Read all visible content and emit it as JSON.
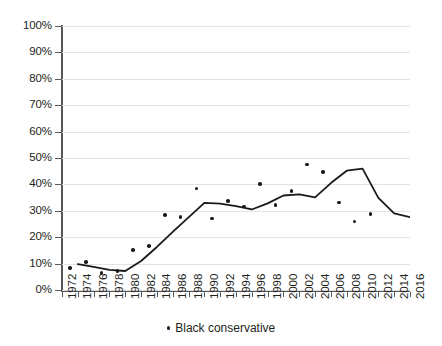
{
  "chart_data": {
    "type": "line",
    "title": "",
    "subtitle": "",
    "xlabel": "",
    "ylabel": "",
    "xlim": [
      1972,
      2016
    ],
    "ylim": [
      0,
      100
    ],
    "grid": true,
    "legend_position": "bottom-center",
    "y_ticks": [
      "0%",
      "10%",
      "20%",
      "30%",
      "40%",
      "50%",
      "60%",
      "70%",
      "80%",
      "90%",
      "100%"
    ],
    "y_tick_values": [
      0,
      10,
      20,
      30,
      40,
      50,
      60,
      70,
      80,
      90,
      100
    ],
    "x_ticks": [
      "1972",
      "1974",
      "1976",
      "1978",
      "1980",
      "1982",
      "1984",
      "1986",
      "1988",
      "1990",
      "1992",
      "1994",
      "1996",
      "1998",
      "2000",
      "2002",
      "2004",
      "2006",
      "2008",
      "2010",
      "2012",
      "2014",
      "2016"
    ],
    "x_tick_values": [
      1972,
      1974,
      1976,
      1978,
      1980,
      1982,
      1984,
      1986,
      1988,
      1990,
      1992,
      1994,
      1996,
      1998,
      2000,
      2002,
      2004,
      2006,
      2008,
      2010,
      2012,
      2014,
      2016
    ],
    "series": [
      {
        "name": "Black conservative",
        "style": "scatter-with-smoothed-trend",
        "color": "#1a1a1a",
        "marker": "dot",
        "x": [
          1972,
          1974,
          1976,
          1978,
          1980,
          1982,
          1984,
          1986,
          1988,
          1990,
          1992,
          1994,
          1996,
          1998,
          2000,
          2002,
          2004,
          2006,
          2008,
          2010,
          2012,
          2014,
          2016
        ],
        "values": [
          8.3,
          10.7,
          6.5,
          7.3,
          15.1,
          16.6,
          28.4,
          27.6,
          38.5,
          27.1,
          33.8,
          31.6,
          40.2,
          32.2,
          37.5,
          47.5,
          44.6,
          33.2,
          25.9,
          28.7,
          null,
          null,
          null
        ]
      },
      {
        "name": "Black conservative (trend line)",
        "style": "line",
        "color": "#1a1a1a",
        "x": [
          1974,
          1976,
          1978,
          1980,
          1982,
          1984,
          1986,
          1988,
          1990,
          1992,
          1994,
          1996,
          1998,
          2000,
          2002,
          2004,
          2006,
          2008,
          2010,
          2012,
          2014,
          2016
        ],
        "values": [
          9.8,
          8.8,
          7.6,
          7.2,
          11.0,
          16.3,
          22.0,
          27.5,
          33.0,
          32.7,
          31.8,
          30.5,
          32.8,
          35.8,
          36.2,
          35.1,
          40.5,
          45.2,
          46.0,
          34.9,
          29.0,
          27.6
        ]
      }
    ],
    "legend": [
      {
        "label": "Black conservative",
        "marker": "dot",
        "color": "#1a1a1a"
      }
    ],
    "colors": {
      "series": "#1a1a1a",
      "gridline": "#e3e3e3",
      "axis": "#58585a",
      "text": "#231f20",
      "background": "#ffffff"
    }
  }
}
